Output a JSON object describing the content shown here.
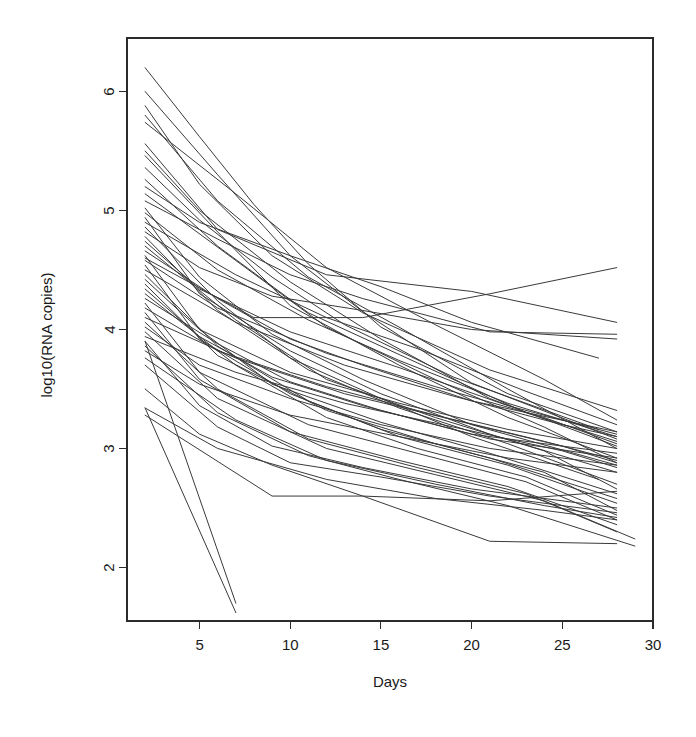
{
  "chart_data": {
    "type": "line",
    "title": "",
    "subtitle": "",
    "xlabel": "Days",
    "ylabel": "log10(RNA copies)",
    "xlim": [
      1,
      30
    ],
    "ylim": [
      1.55,
      6.45
    ],
    "xticks": [
      5,
      10,
      15,
      20,
      25,
      30
    ],
    "xtick_labels": [
      "5",
      "10",
      "15",
      "20",
      "25",
      "30"
    ],
    "yticks": [
      2,
      3,
      4,
      5,
      6
    ],
    "ytick_labels": [
      "2",
      "3",
      "4",
      "5",
      "6"
    ],
    "grid": false,
    "legend": false,
    "legend_position": "none",
    "line_color": "#3a3a3a",
    "background_color": "#ffffff",
    "frame_color": "#2b2b2b",
    "n_series": 52,
    "series": [
      {
        "name": "subject-01",
        "x": [
          2,
          5,
          8,
          11,
          15,
          22,
          28
        ],
        "y": [
          6.2,
          5.62,
          5.05,
          4.55,
          4.02,
          3.46,
          3.14
        ]
      },
      {
        "name": "subject-02",
        "x": [
          2,
          6,
          10,
          14,
          20,
          28
        ],
        "y": [
          6.0,
          5.3,
          4.62,
          4.15,
          3.55,
          3.08
        ]
      },
      {
        "name": "subject-03",
        "x": [
          2,
          5,
          9,
          14,
          21,
          28
        ],
        "y": [
          5.88,
          5.22,
          4.62,
          4.14,
          3.66,
          3.32
        ]
      },
      {
        "name": "subject-04",
        "x": [
          2,
          6,
          11,
          16,
          22,
          28
        ],
        "y": [
          5.8,
          5.08,
          4.44,
          4.02,
          3.5,
          3.0
        ]
      },
      {
        "name": "subject-05",
        "x": [
          2,
          7,
          12,
          18,
          24,
          28
        ],
        "y": [
          5.74,
          5.14,
          4.52,
          4.04,
          3.58,
          3.24
        ]
      },
      {
        "name": "subject-06",
        "x": [
          2,
          5,
          10,
          15,
          21,
          28
        ],
        "y": [
          5.5,
          5.0,
          4.4,
          3.92,
          3.42,
          3.02
        ]
      },
      {
        "name": "subject-07",
        "x": [
          2,
          6,
          10,
          16,
          22,
          28
        ],
        "y": [
          5.46,
          4.82,
          4.2,
          3.7,
          3.26,
          2.92
        ]
      },
      {
        "name": "subject-08",
        "x": [
          2,
          5,
          9,
          13,
          19,
          27
        ],
        "y": [
          5.36,
          4.92,
          4.44,
          4.04,
          3.6,
          3.16
        ]
      },
      {
        "name": "subject-09",
        "x": [
          2,
          6,
          11,
          17,
          23,
          28
        ],
        "y": [
          5.26,
          4.7,
          4.14,
          3.72,
          3.3,
          3.06
        ]
      },
      {
        "name": "subject-10",
        "x": [
          2,
          5,
          10,
          15,
          20,
          27
        ],
        "y": [
          5.2,
          4.9,
          4.62,
          4.36,
          4.06,
          3.76
        ]
      },
      {
        "name": "subject-11",
        "x": [
          2,
          7,
          12,
          18,
          24,
          28
        ],
        "y": [
          5.14,
          4.58,
          4.02,
          3.58,
          3.18,
          2.88
        ]
      },
      {
        "name": "subject-12",
        "x": [
          2,
          6,
          10,
          14,
          21,
          28
        ],
        "y": [
          5.08,
          4.76,
          4.46,
          4.26,
          3.98,
          3.96
        ]
      },
      {
        "name": "subject-13",
        "x": [
          2,
          5,
          9,
          14,
          20,
          28
        ],
        "y": [
          5.02,
          4.44,
          3.96,
          3.58,
          3.2,
          2.86
        ]
      },
      {
        "name": "subject-14",
        "x": [
          2,
          6,
          11,
          16,
          22,
          28
        ],
        "y": [
          4.98,
          4.5,
          4.08,
          3.74,
          3.38,
          3.1
        ]
      },
      {
        "name": "subject-15",
        "x": [
          2,
          5,
          10,
          15,
          21,
          28
        ],
        "y": [
          4.94,
          4.3,
          3.82,
          3.46,
          3.12,
          2.8
        ]
      },
      {
        "name": "subject-16",
        "x": [
          2,
          7,
          12,
          17,
          23,
          28
        ],
        "y": [
          4.9,
          4.46,
          4.1,
          3.84,
          3.48,
          3.2
        ]
      },
      {
        "name": "subject-17",
        "x": [
          2,
          6,
          10,
          15,
          20,
          27
        ],
        "y": [
          4.86,
          4.24,
          3.76,
          3.42,
          3.1,
          2.74
        ]
      },
      {
        "name": "subject-18",
        "x": [
          2,
          5,
          9,
          14,
          20,
          28
        ],
        "y": [
          4.82,
          4.52,
          4.28,
          4.16,
          4.0,
          3.92
        ]
      },
      {
        "name": "subject-19",
        "x": [
          2,
          6,
          11,
          16,
          22,
          28
        ],
        "y": [
          4.78,
          4.16,
          3.66,
          3.34,
          3.04,
          2.7
        ]
      },
      {
        "name": "subject-20",
        "x": [
          2,
          5,
          10,
          16,
          22,
          28
        ],
        "y": [
          4.74,
          4.34,
          3.98,
          3.68,
          3.36,
          3.12
        ]
      },
      {
        "name": "subject-21",
        "x": [
          2,
          7,
          12,
          18,
          24,
          28
        ],
        "y": [
          4.7,
          4.08,
          3.58,
          3.26,
          2.98,
          2.66
        ]
      },
      {
        "name": "subject-22",
        "x": [
          2,
          6,
          10,
          14,
          20,
          28
        ],
        "y": [
          4.66,
          4.26,
          3.92,
          3.7,
          3.4,
          3.14
        ]
      },
      {
        "name": "subject-23",
        "x": [
          2,
          5,
          9,
          15,
          21,
          28
        ],
        "y": [
          4.62,
          4.0,
          3.54,
          3.22,
          2.96,
          2.62
        ]
      },
      {
        "name": "subject-24",
        "x": [
          2,
          6,
          12,
          18,
          24,
          28
        ],
        "y": [
          4.58,
          4.18,
          3.8,
          3.52,
          3.26,
          3.04
        ]
      },
      {
        "name": "subject-25",
        "x": [
          2,
          5,
          10,
          15,
          21,
          28
        ],
        "y": [
          4.54,
          3.92,
          3.46,
          3.16,
          2.92,
          2.58
        ]
      },
      {
        "name": "subject-26",
        "x": [
          2,
          7,
          13,
          19,
          25,
          28
        ],
        "y": [
          4.5,
          4.06,
          3.7,
          3.44,
          3.2,
          3.1
        ]
      },
      {
        "name": "subject-27",
        "x": [
          2,
          6,
          11,
          16,
          22,
          28
        ],
        "y": [
          4.46,
          3.86,
          3.4,
          3.1,
          2.86,
          2.54
        ]
      },
      {
        "name": "subject-28",
        "x": [
          2,
          5,
          10,
          16,
          22,
          28
        ],
        "y": [
          4.42,
          4.0,
          3.64,
          3.38,
          3.16,
          3.0
        ]
      },
      {
        "name": "subject-29",
        "x": [
          2,
          6,
          12,
          18,
          24,
          28
        ],
        "y": [
          4.38,
          3.78,
          3.32,
          3.04,
          2.8,
          2.48
        ]
      },
      {
        "name": "subject-30",
        "x": [
          2,
          5,
          9,
          14,
          20,
          28
        ],
        "y": [
          4.34,
          3.94,
          3.6,
          3.36,
          3.12,
          2.96
        ]
      },
      {
        "name": "subject-31",
        "x": [
          2,
          7,
          12,
          17,
          23,
          28
        ],
        "y": [
          4.3,
          3.7,
          3.26,
          3.0,
          2.76,
          2.44
        ]
      },
      {
        "name": "subject-32",
        "x": [
          2,
          6,
          10,
          15,
          21,
          28
        ],
        "y": [
          4.26,
          3.88,
          3.56,
          3.32,
          3.08,
          2.92
        ]
      },
      {
        "name": "subject-33",
        "x": [
          2,
          5,
          11,
          17,
          23,
          28
        ],
        "y": [
          4.22,
          3.64,
          3.2,
          2.96,
          2.72,
          2.4
        ]
      },
      {
        "name": "subject-34",
        "x": [
          2,
          6,
          12,
          18,
          24,
          28
        ],
        "y": [
          4.18,
          3.82,
          3.52,
          3.28,
          3.06,
          2.9
        ]
      },
      {
        "name": "subject-35",
        "x": [
          2,
          5,
          10,
          16,
          22,
          28
        ],
        "y": [
          4.14,
          3.58,
          3.14,
          2.9,
          2.68,
          2.36
        ]
      },
      {
        "name": "subject-36",
        "x": [
          2,
          7,
          13,
          19,
          25,
          28
        ],
        "y": [
          4.1,
          3.76,
          3.46,
          3.24,
          3.02,
          2.88
        ]
      },
      {
        "name": "subject-37",
        "x": [
          2,
          6,
          11,
          17,
          23,
          28
        ],
        "y": [
          4.06,
          3.5,
          3.08,
          2.84,
          2.62,
          2.3
        ]
      },
      {
        "name": "subject-38",
        "x": [
          2,
          5,
          10,
          15,
          21,
          28
        ],
        "y": [
          4.02,
          3.7,
          3.42,
          3.2,
          3.0,
          2.86
        ]
      },
      {
        "name": "subject-39",
        "x": [
          2,
          6,
          12,
          18,
          24,
          29
        ],
        "y": [
          3.98,
          3.42,
          3.0,
          2.78,
          2.56,
          2.24
        ]
      },
      {
        "name": "subject-40",
        "x": [
          2,
          7,
          13,
          19,
          25,
          28
        ],
        "y": [
          3.94,
          3.64,
          3.38,
          3.18,
          2.98,
          2.84
        ]
      },
      {
        "name": "subject-41",
        "x": [
          2,
          5,
          9,
          14,
          20,
          28
        ],
        "y": [
          3.9,
          3.36,
          3.02,
          2.84,
          2.66,
          2.5
        ]
      },
      {
        "name": "subject-42",
        "x": [
          2,
          6,
          11,
          16,
          22,
          29
        ],
        "y": [
          3.86,
          3.3,
          2.94,
          2.74,
          2.52,
          2.18
        ]
      },
      {
        "name": "subject-43",
        "x": [
          2,
          5,
          10,
          16,
          22,
          28
        ],
        "y": [
          3.82,
          3.54,
          3.28,
          3.1,
          2.92,
          2.8
        ]
      },
      {
        "name": "subject-44",
        "x": [
          2,
          7,
          12,
          18,
          24,
          28
        ],
        "y": [
          3.76,
          3.24,
          2.9,
          2.7,
          2.52,
          2.42
        ]
      },
      {
        "name": "subject-45",
        "x": [
          2,
          6,
          10,
          15,
          21,
          28
        ],
        "y": [
          3.7,
          3.18,
          2.88,
          2.76,
          2.6,
          2.46
        ]
      },
      {
        "name": "subject-46",
        "x": [
          2,
          5,
          9,
          14,
          21,
          28
        ],
        "y": [
          3.5,
          3.12,
          2.86,
          2.6,
          2.56,
          2.64
        ]
      },
      {
        "name": "subject-47",
        "x": [
          2,
          6,
          12,
          18,
          24,
          28
        ],
        "y": [
          3.34,
          3.0,
          2.74,
          2.58,
          2.48,
          2.4
        ]
      },
      {
        "name": "subject-48",
        "x": [
          2,
          9,
          14,
          21,
          28
        ],
        "y": [
          3.28,
          2.6,
          2.6,
          2.22,
          2.2
        ]
      },
      {
        "name": "subject-49",
        "x": [
          2,
          7
        ],
        "y": [
          3.9,
          1.7
        ]
      },
      {
        "name": "subject-50",
        "x": [
          2,
          7
        ],
        "y": [
          3.34,
          1.62
        ]
      },
      {
        "name": "subject-51",
        "x": [
          2,
          8,
          14,
          21,
          28
        ],
        "y": [
          4.6,
          4.1,
          4.1,
          4.3,
          4.52
        ]
      },
      {
        "name": "subject-52",
        "x": [
          2,
          6,
          12,
          20,
          28
        ],
        "y": [
          5.56,
          4.84,
          4.46,
          4.32,
          4.06
        ]
      }
    ]
  },
  "figure": {
    "x_axis_name": "Days",
    "y_axis_name": "log10(RNA copies)"
  }
}
